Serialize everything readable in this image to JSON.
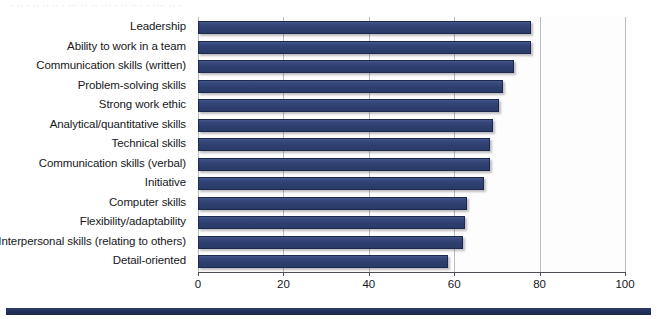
{
  "page": {
    "top_clipped_text": "· ·· · ·· ·· ·· · ··· ·· ·· ··· · ·· ·· · · ···· ·· ·",
    "footer_band_color": "#2a3a68"
  },
  "chart_data": {
    "type": "bar",
    "orientation": "horizontal",
    "title": "",
    "subtitle": "",
    "xlabel": "",
    "ylabel": "",
    "xlim": [
      0,
      100
    ],
    "ylim": null,
    "grid": true,
    "legend": null,
    "legend_position": "none",
    "bar_color": "#2e3f6f",
    "bar_edge_color": "#1d2a4d",
    "xticks": [
      0,
      20,
      40,
      60,
      80,
      100
    ],
    "xticklabels": [
      "0",
      "20",
      "40",
      "60",
      "80",
      "100"
    ],
    "categories": [
      "Leadership",
      "Ability to work in a team",
      "Communication skills (written)",
      "Problem-solving skills",
      "Strong work ethic",
      "Analytical/quantitative skills",
      "Technical skills",
      "Communication skills (verbal)",
      "Initiative",
      "Computer skills",
      "Flexibility/adaptability",
      "Interpersonal skills (relating to others)",
      "Detail-oriented"
    ],
    "values": [
      78.0,
      78.0,
      74.0,
      71.5,
      70.5,
      69.0,
      68.5,
      68.5,
      67.0,
      63.0,
      62.5,
      62.0,
      58.5
    ]
  }
}
